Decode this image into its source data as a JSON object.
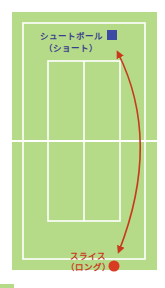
{
  "diagram": {
    "colors": {
      "court": "#b5da88",
      "lines": "#ffffff",
      "arrow": "#c8391e",
      "short_marker": "#3c4aa6",
      "long_marker": "#d93a22",
      "short_label": "#3a3f8c",
      "long_label": "#c8391e",
      "corner_fragment": "#b5da88"
    },
    "markers": [
      {
        "id": "short",
        "shape": "square",
        "label_line1": "シュートボール",
        "label_line2": "（ショート）"
      },
      {
        "id": "long",
        "shape": "circle",
        "label_line1": "スライス",
        "label_line2": "（ロング）"
      }
    ],
    "arrow": {
      "type": "double-headed curved",
      "from": "long",
      "to": "short"
    }
  }
}
